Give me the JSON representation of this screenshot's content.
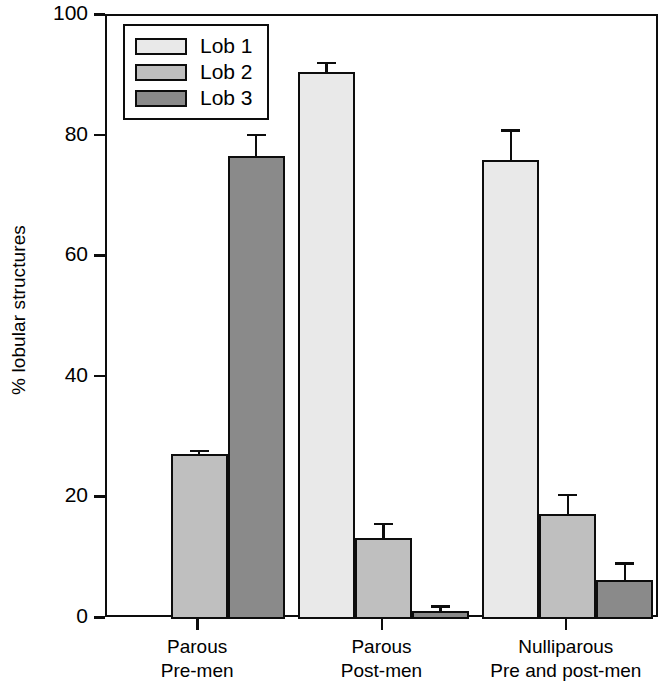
{
  "chart_data": {
    "type": "bar",
    "title": "",
    "xlabel": "",
    "ylabel": "% lobular structures",
    "ylim": [
      0,
      100
    ],
    "yticks": [
      0,
      20,
      40,
      60,
      80,
      100
    ],
    "grid": false,
    "legend_position": "top-left",
    "categories": [
      "Parous\nPre-men",
      "Parous\nPost-men",
      "Nulliparous\nPre and post-men"
    ],
    "series": [
      {
        "name": "Lob 1",
        "color": "#e9e9e9",
        "values": [
          0,
          90.7,
          76.2
        ],
        "errors": [
          0,
          1.7,
          5.0
        ]
      },
      {
        "name": "Lob 2",
        "color": "#bfbfbf",
        "values": [
          27.4,
          13.4,
          17.4
        ],
        "errors": [
          0.7,
          2.6,
          3.4
        ]
      },
      {
        "name": "Lob 3",
        "color": "#8a8a8a",
        "values": [
          76.7,
          1.4,
          6.5
        ],
        "errors": [
          3.8,
          0.9,
          2.9
        ]
      }
    ]
  },
  "axis": {
    "y_label": "% lobular structures",
    "y_tick_labels": [
      "0",
      "20",
      "40",
      "60",
      "80",
      "100"
    ],
    "x_tick_labels": [
      "Parous\nPre-men",
      "Parous\nPost-men",
      "Nulliparous\nPre and post-men"
    ]
  },
  "legend": {
    "entries": [
      {
        "label": "Lob 1",
        "color": "#e9e9e9"
      },
      {
        "label": "Lob 2",
        "color": "#bfbfbf"
      },
      {
        "label": "Lob 3",
        "color": "#8a8a8a"
      }
    ]
  },
  "colors": {
    "axis": "#0d0d0d",
    "background": "#ffffff",
    "lob1": "#e9e9e9",
    "lob2": "#bfbfbf",
    "lob3": "#8a8a8a"
  }
}
